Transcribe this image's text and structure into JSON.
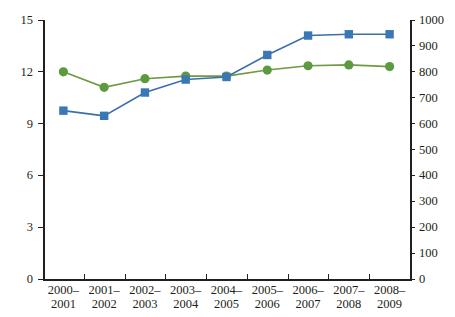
{
  "chart_data": {
    "type": "line",
    "title": "",
    "xlabel": "",
    "grid": false,
    "legend": "none",
    "categories": [
      "2000–\n2001",
      "2001–\n2002",
      "2002–\n2003",
      "2003–\n2004",
      "2004–\n2005",
      "2005–\n2006",
      "2006–\n2007",
      "2007–\n2008",
      "2008–\n2009"
    ],
    "category_lines": [
      [
        "2000–",
        "2001"
      ],
      [
        "2001–",
        "2002"
      ],
      [
        "2002–",
        "2003"
      ],
      [
        "2003–",
        "2004"
      ],
      [
        "2004–",
        "2005"
      ],
      [
        "2005–",
        "2006"
      ],
      [
        "2006–",
        "2007"
      ],
      [
        "2007–",
        "2008"
      ],
      [
        "2008–",
        "2009"
      ]
    ],
    "axes": {
      "left": {
        "ylabel": "",
        "ylim": [
          0,
          15
        ],
        "ticks": [
          0,
          3,
          6,
          9,
          12,
          15
        ],
        "tick_labels": [
          "0",
          "3",
          "6",
          "9",
          "12",
          "15"
        ]
      },
      "right": {
        "ylabel": "",
        "ylim": [
          0,
          1000
        ],
        "ticks": [
          0,
          100,
          200,
          300,
          400,
          500,
          600,
          700,
          800,
          900,
          1000
        ],
        "tick_labels": [
          "0",
          "100",
          "200",
          "300",
          "400",
          "500",
          "600",
          "700",
          "800",
          "900",
          "1000"
        ]
      }
    },
    "series": [
      {
        "name": "green-series",
        "axis": "left",
        "color": "#5c9a3f",
        "line_color": "#6f9a42",
        "marker": "circle",
        "values": [
          12.0,
          11.1,
          11.6,
          11.75,
          11.75,
          12.1,
          12.35,
          12.4,
          12.3
        ]
      },
      {
        "name": "blue-series",
        "axis": "right",
        "color": "#3a77b5",
        "line_color": "#3a6fae",
        "marker": "square",
        "values": [
          650,
          630,
          720,
          770,
          780,
          865,
          940,
          945,
          945
        ]
      }
    ]
  }
}
